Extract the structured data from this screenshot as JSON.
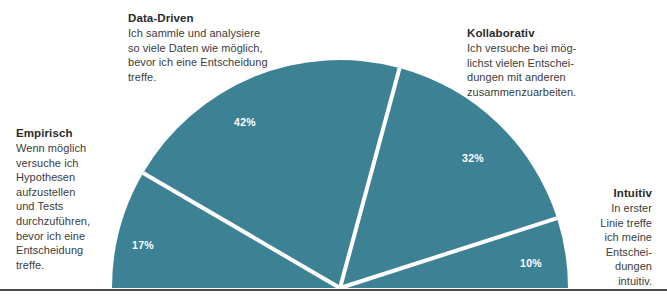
{
  "chart_data": {
    "type": "pie",
    "variant": "semicircle",
    "title": "",
    "subtitle": "",
    "xlabel": "",
    "ylabel": "",
    "legend_position": "callouts",
    "grid": false,
    "total_degrees": 180,
    "start_angle_deg": 180,
    "colors": {
      "slice": "#3d8294",
      "separator": "#ffffff",
      "baseline": "#4a4a4a",
      "label": "#ffffff",
      "text": "#3c3c3c",
      "heading": "#2b2b2b"
    },
    "categories": [
      "Empirisch",
      "Data-Driven",
      "Kollaborativ",
      "Intuitiv"
    ],
    "values": [
      17,
      42,
      32,
      10
    ],
    "value_labels": [
      "17%",
      "42%",
      "32%",
      "10%"
    ],
    "slices": [
      {
        "name": "Empirisch",
        "value": 17,
        "label": "17%",
        "label_x": 143,
        "label_y": 245
      },
      {
        "name": "Data-Driven",
        "value": 42,
        "label": "42%",
        "label_x": 245,
        "label_y": 122
      },
      {
        "name": "Kollaborativ",
        "value": 32,
        "label": "32%",
        "label_x": 473,
        "label_y": 158
      },
      {
        "name": "Intuitiv",
        "value": 10,
        "label": "10%",
        "label_x": 531,
        "label_y": 263
      }
    ],
    "annotations": [
      {
        "key": "data_driven",
        "title": "Data-Driven",
        "body": "Ich sammle und analysiere\nso viele Daten wie möglich,\nbevor ich eine Entscheidung\ntreffe."
      },
      {
        "key": "kollaborativ",
        "title": "Kollaborativ",
        "body": "Ich versuche bei mög-\nlichst vielen Entschei-\ndungen mit anderen\nzusammenzuarbeiten."
      },
      {
        "key": "empirisch",
        "title": "Empirisch",
        "body": "Wenn möglich\nversuche ich\nHypothesen\naufzustellen\nund Tests\ndurchzuführen,\nbevor ich eine\nEntscheidung\ntreffe."
      },
      {
        "key": "intuitiv",
        "title": "Intuitiv",
        "body": "In erster\nLinie treffe\nich meine\nEntschei-\ndungen\nintuitiv."
      }
    ]
  },
  "callouts": {
    "data_driven": {
      "title": "Data-Driven",
      "body": "Ich sammle und analysiere\nso viele Daten wie möglich,\nbevor ich eine Entscheidung\ntreffe."
    },
    "kollaborativ": {
      "title": "Kollaborativ",
      "body": "Ich versuche bei mög-\nlichst vielen Entschei-\ndungen mit anderen\nzusammenzuarbeiten."
    },
    "empirisch": {
      "title": "Empirisch",
      "body": "Wenn möglich\nversuche ich\nHypothesen\naufzustellen\nund Tests\ndurchzuführen,\nbevor ich eine\nEntscheidung\ntreffe."
    },
    "intuitiv": {
      "title": "Intuitiv",
      "body": "In erster\nLinie treffe\nich meine\nEntschei-\ndungen\nintuitiv."
    }
  },
  "values": {
    "empirisch": "17%",
    "data_driven": "42%",
    "kollaborativ": "32%",
    "intuitiv": "10%"
  }
}
